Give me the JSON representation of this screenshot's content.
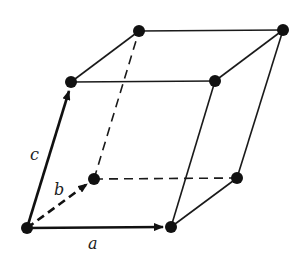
{
  "diagram": {
    "labels": {
      "a": "a",
      "b": "b",
      "c": "c"
    },
    "colors": {
      "stroke": "#1a1a1a",
      "node": "#111111",
      "background": "#ffffff"
    },
    "nodes": {
      "origin": [
        27,
        228
      ],
      "a_end": [
        171,
        227
      ],
      "b_end": [
        94,
        179
      ],
      "ab": [
        237,
        178
      ],
      "c_end": [
        71,
        82
      ],
      "ac": [
        215,
        81
      ],
      "bc": [
        139,
        31
      ],
      "abc": [
        283,
        30
      ]
    }
  }
}
